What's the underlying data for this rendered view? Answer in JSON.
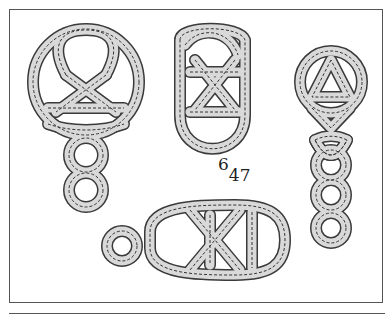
{
  "figure": {
    "label": {
      "base": "6",
      "superscript": "",
      "subscript": "47",
      "display_sup": "6",
      "display_sub": "47"
    },
    "knots": [
      {
        "id": "knot-circle-top-left",
        "description": "circular knot with triangle interior and two-loop tail"
      },
      {
        "id": "knot-oval-middle",
        "description": "oval knot with crossed interior and D-shaped bottom loop"
      },
      {
        "id": "knot-circle-right",
        "description": "circular knot with triangle interior and long chain tail"
      },
      {
        "id": "knot-horizontal-bottom",
        "description": "horizontal knot with left loop and crossed interior"
      }
    ],
    "colors": {
      "band_fill": "#d9d9d9",
      "band_edge": "#3a3a3a",
      "frame": "#555555",
      "background": "#ffffff"
    }
  }
}
